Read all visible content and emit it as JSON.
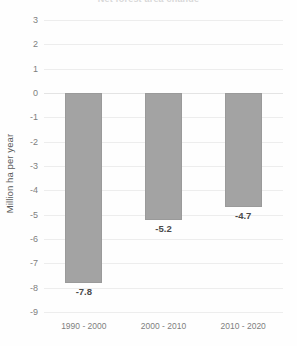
{
  "chart_data": {
    "type": "bar",
    "title": "",
    "title_remnant": "Net forest area change",
    "categories": [
      "1990 - 2000",
      "2000 - 2010",
      "2010 - 2020"
    ],
    "values": [
      -7.8,
      -5.2,
      -4.7
    ],
    "data_labels": [
      "-7.8",
      "-5.2",
      "-4.7"
    ],
    "xlabel": "",
    "ylabel": "Million ha per year",
    "ylim": [
      -9,
      3
    ],
    "ytick_step": 1,
    "ytick_labels": [
      "3",
      "2",
      "1",
      "0",
      "-1",
      "-2",
      "-3",
      "-4",
      "-5",
      "-6",
      "-7",
      "-8",
      "-9"
    ],
    "ytick_values": [
      3,
      2,
      1,
      0,
      -1,
      -2,
      -3,
      -4,
      -5,
      -6,
      -7,
      -8,
      -9
    ],
    "grid": true,
    "grid_axis": "y",
    "legend": false,
    "legend_position": "none",
    "series": [
      {
        "name": "Net forest area change",
        "values": [
          -7.8,
          -5.2,
          -4.7
        ]
      }
    ],
    "colors": {
      "bar_fill": "#a3a3a3",
      "bar_border": "#9a9a9a",
      "gridline": "#ededed",
      "zero_line": "#e4e4e4",
      "tick_text": "#7f7f7f",
      "axis_title_text": "#595959",
      "data_label_text": "#4a4a4a",
      "background": "#fefefe"
    }
  }
}
